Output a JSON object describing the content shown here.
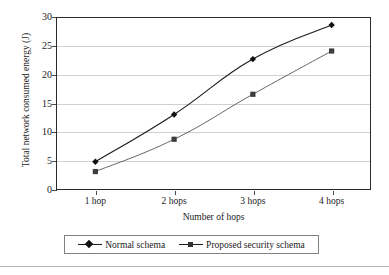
{
  "chart_data": {
    "type": "line",
    "title": "",
    "xlabel": "Number of hops",
    "ylabel": "Total network consumed energy (J)",
    "categories": [
      "1 hop",
      "2 hops",
      "3 hops",
      "4 hops"
    ],
    "yticks": [
      0,
      5,
      10,
      15,
      20,
      25,
      30
    ],
    "ylim": [
      0,
      30
    ],
    "grid": true,
    "legend_position": "bottom",
    "series": [
      {
        "name": "Normal schema",
        "marker": "diamond",
        "color": "#1a1a1a",
        "values": [
          4.9,
          13.1,
          22.7,
          28.6
        ]
      },
      {
        "name": "Proposed security schema",
        "marker": "square",
        "color": "#555555",
        "values": [
          3.2,
          8.8,
          16.6,
          24.1
        ]
      }
    ]
  },
  "axis": {
    "ylabel_text": "Total network consumed energy (J)",
    "xlabel_text": "Number of hops",
    "ytick_labels": [
      "0",
      "5",
      "10",
      "15",
      "20",
      "25",
      "30"
    ],
    "xtick_labels": [
      "1 hop",
      "2 hops",
      "3 hops",
      "4 hops"
    ]
  },
  "legend": {
    "items": [
      {
        "label": "Normal schema",
        "marker": "diamond"
      },
      {
        "label": "Proposed security schema",
        "marker": "square"
      }
    ]
  }
}
